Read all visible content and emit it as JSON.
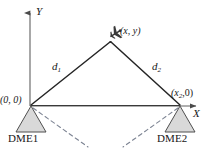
{
  "figure": {
    "type": "geometry-diagram",
    "background_color": "#ffffff",
    "line_color": "#2b2b2b",
    "axis_color": "#555555",
    "station_fill": "#d8d8d8",
    "dashed_color": "#7a8190"
  },
  "axes": {
    "y_label": "Y",
    "x_label": "X",
    "origin_label": "(0, 0)"
  },
  "aircraft": {
    "icon": "airplane-icon",
    "label_open": "(",
    "label_x": "x",
    "label_sep": ", ",
    "label_y": "y",
    "label_close": ")",
    "label_full": "(x, y)"
  },
  "distances": [
    {
      "name": "d1",
      "base": "d",
      "subscript": "1"
    },
    {
      "name": "d2",
      "base": "d",
      "subscript": "2"
    }
  ],
  "stations": [
    {
      "name": "DME1",
      "label": "DME1",
      "coord_open": "(0, 0)",
      "coord_full": "(0, 0)"
    },
    {
      "name": "DME2",
      "label": "DME2",
      "coord_open": "(",
      "coord_base": "x",
      "coord_sub": "2",
      "coord_rest": ",0)",
      "coord_full": "(x2,0)"
    }
  ]
}
